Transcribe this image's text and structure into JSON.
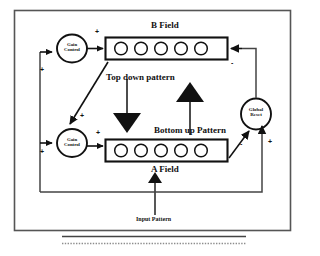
{
  "diagram": {
    "frame": {
      "name": "outer-frame"
    },
    "fields": {
      "b_field": {
        "label": "B Field",
        "units": 5
      },
      "a_field": {
        "label": "A Field",
        "units": 5
      }
    },
    "nodes": {
      "gain_control_top": {
        "line1": "Gain",
        "line2": "Control"
      },
      "gain_control_bottom": {
        "line1": "Gain",
        "line2": "Control"
      },
      "global_reset": {
        "line1": "Global",
        "line2": "Reset"
      }
    },
    "arrow_labels": {
      "top_down": "Top down pattern",
      "bottom_up": "Bottom up  Pattern",
      "input": "Input Pattern"
    },
    "signs": {
      "b_gain_out_plus": "+",
      "left_bus_top_plus": "+",
      "diagonal_plus": "+",
      "a_gain_in_plus": "+",
      "a_gain_out_plus": "+",
      "b_reset_minus": "-",
      "a_reset_minus": "-",
      "reset_in_plus": "+"
    },
    "colors": {
      "ink": "#111111",
      "background": "#ffffff",
      "frame": "#555555",
      "dotted": "#888888"
    }
  }
}
